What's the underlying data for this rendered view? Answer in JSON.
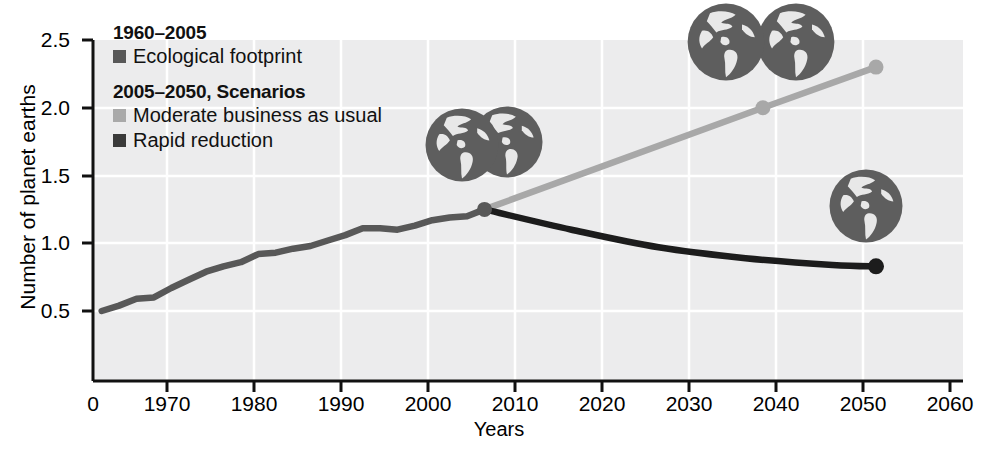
{
  "chart_data": {
    "type": "line",
    "title": "",
    "subtitle": "",
    "xlabel": "Years",
    "ylabel": "Number of planet earths",
    "xlim": [
      1960,
      2060
    ],
    "ylim": [
      0,
      2.5
    ],
    "grid": true,
    "legend_position": "top-left-inside",
    "x_ticks": [
      "0",
      "1970",
      "1980",
      "1990",
      "2000",
      "2010",
      "2020",
      "2030",
      "2040",
      "2050",
      "2060"
    ],
    "x_tick_values": [
      1960,
      1970,
      1980,
      1990,
      2000,
      2010,
      2020,
      2030,
      2040,
      2050,
      2060
    ],
    "y_ticks": [
      "0.5",
      "1.0",
      "1.5",
      "2.0",
      "2.5"
    ],
    "y_tick_values": [
      0.5,
      1.0,
      1.5,
      2.0,
      2.5
    ],
    "series": [
      {
        "name": "Ecological footprint",
        "period": "1960-2005",
        "color": "#585858",
        "x": [
          1961,
          1963,
          1965,
          1967,
          1969,
          1971,
          1973,
          1975,
          1977,
          1979,
          1981,
          1983,
          1985,
          1987,
          1989,
          1991,
          1993,
          1995,
          1997,
          1999,
          2001,
          2003,
          2005
        ],
        "values": [
          0.5,
          0.54,
          0.59,
          0.6,
          0.67,
          0.73,
          0.79,
          0.83,
          0.86,
          0.92,
          0.93,
          0.96,
          0.98,
          1.02,
          1.06,
          1.11,
          1.11,
          1.1,
          1.13,
          1.17,
          1.19,
          1.2,
          1.25
        ]
      },
      {
        "name": "Moderate business as usual",
        "period": "2005-2050",
        "color": "#a8a8a8",
        "x": [
          2005,
          2037,
          2050
        ],
        "values": [
          1.25,
          2.0,
          2.3
        ],
        "markers": [
          2037,
          2050
        ]
      },
      {
        "name": "Rapid reduction",
        "period": "2005-2050",
        "color": "#1c1c1c",
        "x": [
          2005,
          2015,
          2025,
          2035,
          2045,
          2050
        ],
        "values": [
          1.25,
          1.1,
          0.97,
          0.89,
          0.84,
          0.83
        ],
        "markers": [
          2050
        ]
      }
    ],
    "annotations": [
      {
        "name": "globes-2005",
        "x": 2005,
        "y": 1.55,
        "earths": 1.25
      },
      {
        "name": "globes-2050-bau",
        "x": 2047,
        "y": 2.45,
        "earths": 2.3
      },
      {
        "name": "globe-2050-rapid",
        "x": 2050,
        "y": 1.1,
        "earths": 0.83
      }
    ]
  },
  "legend": {
    "group1_title": "1960–2005",
    "group1_items": [
      {
        "label": "Ecological footprint",
        "color": "#585858"
      }
    ],
    "group2_title": "2005–2050, Scenarios",
    "group2_items": [
      {
        "label": "Moderate business as usual",
        "color": "#a9a9a9"
      },
      {
        "label": "Rapid reduction",
        "color": "#3a3a3a"
      }
    ]
  },
  "axes": {
    "y_title": "Number of planet earths",
    "x_title": "Years",
    "y_tick_labels": [
      "2.5",
      "2.0",
      "1.5",
      "1.0",
      "0.5"
    ],
    "x_tick_labels": [
      "0",
      "1970",
      "1980",
      "1990",
      "2000",
      "2010",
      "2020",
      "2030",
      "2040",
      "2050",
      "2060"
    ]
  },
  "colors": {
    "plot_background": "#ececed",
    "gridline": "#ffffff",
    "axis": "#1a1a1a",
    "historical_line": "#585858",
    "bau_line": "#a8a8a8",
    "rapid_line": "#1c1c1c",
    "globe_dark": "#5e5e5e",
    "globe_light": "#e7e7e7"
  }
}
